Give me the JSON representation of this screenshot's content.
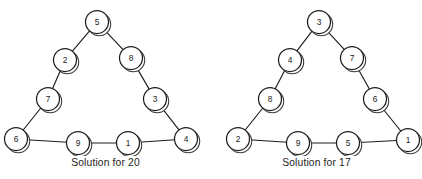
{
  "figure": {
    "panels": [
      {
        "id": "solution-20",
        "caption": "Solution for 20",
        "target_sum": 20,
        "nodes": [
          {
            "label": "5",
            "position": "top-vertex",
            "cx": 97,
            "cy": 22
          },
          {
            "label": "2",
            "position": "left-edge-upper",
            "cx": 65,
            "cy": 60
          },
          {
            "label": "8",
            "position": "right-edge-upper",
            "cx": 131,
            "cy": 58
          },
          {
            "label": "7",
            "position": "left-edge-lower",
            "cx": 48,
            "cy": 99
          },
          {
            "label": "3",
            "position": "right-edge-lower",
            "cx": 155,
            "cy": 99
          },
          {
            "label": "6",
            "position": "bottom-left-vertex",
            "cx": 16,
            "cy": 139
          },
          {
            "label": "9",
            "position": "bottom-edge-left",
            "cx": 78,
            "cy": 143
          },
          {
            "label": "1",
            "position": "bottom-edge-right",
            "cx": 128,
            "cy": 143
          },
          {
            "label": "4",
            "position": "bottom-right-vertex",
            "cx": 186,
            "cy": 139
          }
        ],
        "edges": [
          {
            "from": "5",
            "to": "2"
          },
          {
            "from": "2",
            "to": "7"
          },
          {
            "from": "7",
            "to": "6"
          },
          {
            "from": "5",
            "to": "8"
          },
          {
            "from": "8",
            "to": "3"
          },
          {
            "from": "3",
            "to": "4"
          },
          {
            "from": "6",
            "to": "9"
          },
          {
            "from": "9",
            "to": "1"
          },
          {
            "from": "1",
            "to": "4"
          }
        ],
        "sides": [
          {
            "name": "left-side",
            "values": [
              5,
              2,
              7,
              6
            ],
            "sum": 20
          },
          {
            "name": "right-side",
            "values": [
              5,
              8,
              3,
              4
            ],
            "sum": 20
          },
          {
            "name": "bottom-side",
            "values": [
              6,
              9,
              1,
              4
            ],
            "sum": 20
          }
        ]
      },
      {
        "id": "solution-17",
        "caption": "Solution for 17",
        "target_sum": 17,
        "nodes": [
          {
            "label": "3",
            "position": "top-vertex",
            "cx": 108,
            "cy": 22
          },
          {
            "label": "4",
            "position": "left-edge-upper",
            "cx": 79,
            "cy": 60
          },
          {
            "label": "7",
            "position": "right-edge-upper",
            "cx": 141,
            "cy": 58
          },
          {
            "label": "8",
            "position": "left-edge-lower",
            "cx": 59,
            "cy": 99
          },
          {
            "label": "6",
            "position": "right-edge-lower",
            "cx": 164,
            "cy": 99
          },
          {
            "label": "2",
            "position": "bottom-left-vertex",
            "cx": 27,
            "cy": 139
          },
          {
            "label": "9",
            "position": "bottom-edge-left",
            "cx": 87,
            "cy": 143
          },
          {
            "label": "5",
            "position": "bottom-edge-right",
            "cx": 137,
            "cy": 143
          },
          {
            "label": "1",
            "position": "bottom-right-vertex",
            "cx": 197,
            "cy": 140
          }
        ],
        "edges": [
          {
            "from": "3",
            "to": "4"
          },
          {
            "from": "4",
            "to": "8"
          },
          {
            "from": "8",
            "to": "2"
          },
          {
            "from": "3",
            "to": "7"
          },
          {
            "from": "7",
            "to": "6"
          },
          {
            "from": "6",
            "to": "1"
          },
          {
            "from": "2",
            "to": "9"
          },
          {
            "from": "9",
            "to": "5"
          },
          {
            "from": "5",
            "to": "1"
          }
        ],
        "sides": [
          {
            "name": "left-side",
            "values": [
              3,
              4,
              8,
              2
            ],
            "sum": 17
          },
          {
            "name": "right-side",
            "values": [
              3,
              7,
              6,
              1
            ],
            "sum": 17
          },
          {
            "name": "bottom-side",
            "values": [
              2,
              9,
              5,
              1
            ],
            "sum": 17
          }
        ]
      }
    ]
  },
  "style": {
    "node_radius": 11.5,
    "shadow_offset_x": 2.2,
    "shadow_offset_y": 2.2,
    "ink_color": "#1d1d1b",
    "shadow_color": "#3a3a38",
    "background": "#ffffff"
  }
}
